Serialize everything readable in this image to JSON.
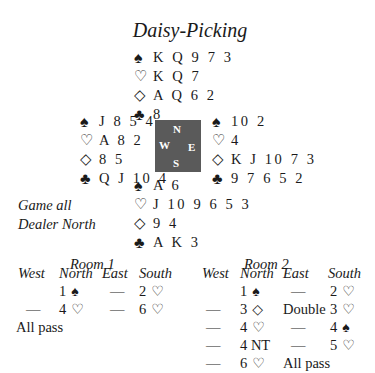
{
  "title": "Daisy-Picking",
  "compass": {
    "n": "N",
    "e": "E",
    "s": "S",
    "w": "W",
    "color": "#5a5a5a"
  },
  "suits": {
    "spades": "♠",
    "hearts": "♡",
    "diamonds": "◇",
    "clubs": "♣"
  },
  "hands": {
    "north": {
      "spades": "K Q 9 7 3",
      "hearts": "K Q 7",
      "diamonds": "A Q 6 2",
      "clubs": "8"
    },
    "west": {
      "spades": "J 8 5 4",
      "hearts": "A 8 2",
      "diamonds": "8 5",
      "clubs": "Q J 10 4"
    },
    "east": {
      "spades": "10 2",
      "hearts": "4",
      "diamonds": "K J 10 7 3",
      "clubs": "9 7 6 5 2"
    },
    "south": {
      "spades": "A 6",
      "hearts": "J 10 9 6 5 3",
      "diamonds": "9 4",
      "clubs": "A K 3"
    }
  },
  "meta": {
    "vulnerability": "Game all",
    "dealer": "Dealer North"
  },
  "auctions": [
    {
      "room": "Room 1",
      "headers": [
        "West",
        "North",
        "East",
        "South"
      ],
      "rows": [
        [
          {
            "t": ""
          },
          {
            "t": "1",
            "s": "♠"
          },
          {
            "t": "—"
          },
          {
            "t": "2",
            "s": "♡"
          }
        ],
        [
          {
            "t": "—"
          },
          {
            "t": "4",
            "s": "♡"
          },
          {
            "t": "—"
          },
          {
            "t": "6",
            "s": "♡"
          }
        ],
        [
          {
            "t": "All pass"
          }
        ]
      ]
    },
    {
      "room": "Room 2",
      "headers": [
        "West",
        "North",
        "East",
        "South"
      ],
      "rows": [
        [
          {
            "t": ""
          },
          {
            "t": "1",
            "s": "♠"
          },
          {
            "t": "—"
          },
          {
            "t": "2",
            "s": "♡"
          }
        ],
        [
          {
            "t": "—"
          },
          {
            "t": "3",
            "s": "◇"
          },
          {
            "t": "Double"
          },
          {
            "t": "3",
            "s": "♡"
          }
        ],
        [
          {
            "t": "—"
          },
          {
            "t": "4",
            "s": "♡"
          },
          {
            "t": "—"
          },
          {
            "t": "4",
            "s": "♠"
          }
        ],
        [
          {
            "t": "—"
          },
          {
            "t": "4 NT"
          },
          {
            "t": "—"
          },
          {
            "t": "5",
            "s": "♡"
          }
        ],
        [
          {
            "t": "—"
          },
          {
            "t": "6",
            "s": "♡"
          },
          {
            "t": "All pass"
          }
        ]
      ]
    }
  ]
}
